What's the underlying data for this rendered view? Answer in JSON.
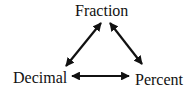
{
  "diagram": {
    "nodes": {
      "fraction": "Fraction",
      "decimal": "Decimal",
      "percent": "Percent"
    },
    "edges": [
      {
        "from": "Fraction",
        "to": "Decimal",
        "type": "double-arrow"
      },
      {
        "from": "Fraction",
        "to": "Percent",
        "type": "double-arrow"
      },
      {
        "from": "Decimal",
        "to": "Percent",
        "type": "double-arrow"
      }
    ],
    "colors": {
      "ink": "#111111",
      "background": "#ffffff"
    }
  }
}
